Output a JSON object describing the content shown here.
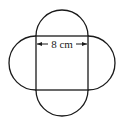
{
  "figure": {
    "dimension_label": "8 cm",
    "colors": {
      "stroke": "#1a1a1a",
      "background": "#ffffff"
    }
  }
}
